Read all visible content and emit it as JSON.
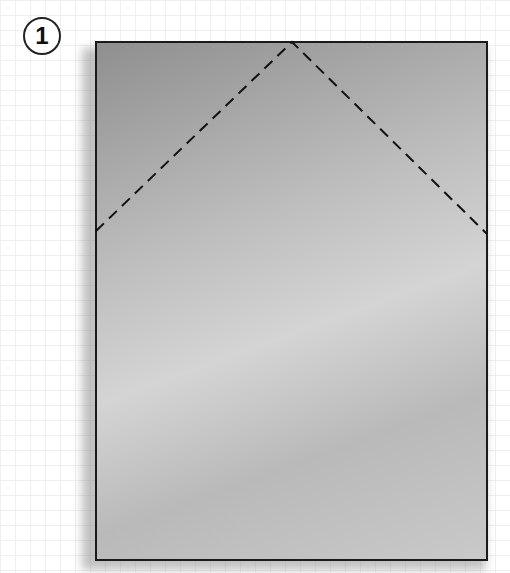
{
  "step": {
    "number": "1"
  },
  "diagram": {
    "type": "origami-fold-step",
    "paper": {
      "left": 95,
      "top": 41,
      "right": 488,
      "bottom": 561
    },
    "fold_lines": [
      {
        "style": "dashed",
        "from": [
          96,
          231
        ],
        "to": [
          292,
          42
        ]
      },
      {
        "style": "dashed",
        "from": [
          292,
          42
        ],
        "to": [
          487,
          234
        ]
      }
    ],
    "colors": {
      "paper": "#bdbdbd",
      "outline": "#1a1a1a",
      "grid": "#eef0f0"
    }
  }
}
